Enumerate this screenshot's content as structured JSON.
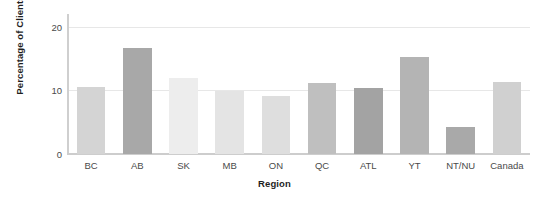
{
  "chart_data": {
    "type": "bar",
    "title": "",
    "xlabel": "Region",
    "ylabel": "Percentage of Clients",
    "categories": [
      "BC",
      "AB",
      "SK",
      "MB",
      "ON",
      "QC",
      "ATL",
      "YT",
      "NT/NU",
      "Canada"
    ],
    "values": [
      10.6,
      16.7,
      11.9,
      9.9,
      9.1,
      11.1,
      10.3,
      15.3,
      4.2,
      11.3
    ],
    "bar_colors": [
      "#d4d4d4",
      "#a8a8a8",
      "#ededed",
      "#e4e4e4",
      "#dedede",
      "#bfbfbf",
      "#a3a3a3",
      "#b4b4b4",
      "#a9a9a9",
      "#d0d0d0"
    ],
    "ylim": [
      0,
      22
    ],
    "yticks": [
      0,
      10,
      20
    ],
    "ytick_labels": [
      "0",
      "10",
      "20"
    ],
    "grid": true,
    "gridline_color": "#e7e7e7",
    "axis_color": "#cdcdcd",
    "legend": "none",
    "background": "#ffffff"
  }
}
